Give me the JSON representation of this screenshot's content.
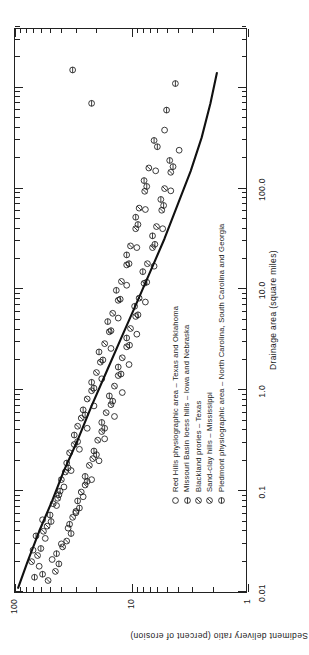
{
  "figure": {
    "orientation": "rotated-90-ccw",
    "line_color": "#111111",
    "axis_color": "#222222"
  },
  "chart_data": {
    "type": "scatter",
    "title": "",
    "xlabel": "Drainage area (square miles)",
    "ylabel": "Sediment delivery ratio (percent of erosion)",
    "xscale": "log",
    "yscale": "log",
    "xlim": [
      0.01,
      4000
    ],
    "ylim": [
      1,
      100
    ],
    "xticks": [
      0.01,
      0.1,
      1.0,
      10.0,
      100.0
    ],
    "xtick_labels": [
      "0.01",
      "0.1",
      "1.0",
      "10.0",
      "100.0"
    ],
    "yticks": [
      1,
      10,
      100
    ],
    "ytick_labels": [
      "1",
      "10",
      "100"
    ],
    "grid": false,
    "legend_position": "inside-lower-right",
    "series": [
      {
        "name": "Red Hills physiographic area – Texas and Oklahoma",
        "marker": "open-circle",
        "points": [
          [
            0.018,
            62
          ],
          [
            0.021,
            48
          ],
          [
            0.026,
            70
          ],
          [
            0.03,
            40
          ],
          [
            0.034,
            55
          ],
          [
            0.043,
            35
          ],
          [
            0.052,
            58
          ],
          [
            0.061,
            30
          ],
          [
            0.072,
            44
          ],
          [
            0.088,
            26
          ],
          [
            0.11,
            38
          ],
          [
            0.13,
            22
          ],
          [
            0.16,
            33
          ],
          [
            0.2,
            19
          ],
          [
            0.26,
            28
          ],
          [
            0.33,
            17
          ],
          [
            0.42,
            24
          ],
          [
            0.55,
            14
          ],
          [
            0.7,
            21
          ],
          [
            0.95,
            12
          ],
          [
            1.3,
            18
          ],
          [
            1.8,
            10.5
          ],
          [
            2.6,
            15
          ],
          [
            3.6,
            9.0
          ],
          [
            5.2,
            13
          ],
          [
            7.5,
            7.6
          ],
          [
            11,
            11
          ],
          [
            17,
            6.4
          ],
          [
            26,
            9.0
          ],
          [
            40,
            5.4
          ],
          [
            62,
            7.6
          ],
          [
            95,
            4.6
          ],
          [
            150,
            6.2
          ],
          [
            240,
            3.9
          ],
          [
            380,
            5.2
          ]
        ]
      },
      {
        "name": "Missouri Basin loess hills – Iowa and Nebraska",
        "marker": "circle-hbar",
        "points": [
          [
            0.015,
            58
          ],
          [
            0.024,
            44
          ],
          [
            0.036,
            66
          ],
          [
            0.047,
            34
          ],
          [
            0.058,
            50
          ],
          [
            0.08,
            29
          ],
          [
            0.1,
            41
          ],
          [
            0.14,
            25
          ],
          [
            0.19,
            36
          ],
          [
            0.25,
            21
          ],
          [
            0.36,
            31
          ],
          [
            0.48,
            18
          ],
          [
            0.64,
            26
          ],
          [
            0.88,
            15.5
          ],
          [
            1.2,
            22
          ],
          [
            1.7,
            13
          ],
          [
            2.4,
            19
          ],
          [
            3.3,
            11
          ],
          [
            4.8,
            16
          ],
          [
            6.8,
            9.4
          ],
          [
            9.8,
            13.5
          ],
          [
            15,
            8.0
          ],
          [
            22,
            11
          ],
          [
            34,
            6.6
          ],
          [
            52,
            9.2
          ],
          [
            78,
            5.6
          ],
          [
            120,
            7.8
          ],
          [
            190,
            4.7
          ],
          [
            300,
            6.4
          ],
          [
            600,
            5.0
          ],
          [
            1100,
            4.2
          ]
        ]
      },
      {
        "name": "Blackland prories – Texas",
        "marker": "circle-slash",
        "points": [
          [
            0.013,
            52
          ],
          [
            0.02,
            72
          ],
          [
            0.028,
            39
          ],
          [
            0.04,
            57
          ],
          [
            0.055,
            32
          ],
          [
            0.075,
            47
          ],
          [
            0.098,
            27
          ],
          [
            0.13,
            40
          ],
          [
            0.18,
            23
          ],
          [
            0.24,
            34
          ],
          [
            0.32,
            19.5
          ],
          [
            0.44,
            29
          ],
          [
            0.6,
            16.5
          ],
          [
            0.82,
            24
          ],
          [
            1.1,
            14
          ],
          [
            1.5,
            20
          ],
          [
            2.1,
            12
          ],
          [
            2.9,
            17
          ],
          [
            4.1,
            10.2
          ],
          [
            5.8,
            14.5
          ],
          [
            8.2,
            8.6
          ],
          [
            12,
            12.2
          ],
          [
            18,
            7.3
          ],
          [
            27,
            10.2
          ],
          [
            42,
            6.1
          ],
          [
            64,
            8.6
          ],
          [
            100,
            5.2
          ],
          [
            160,
            7.1
          ]
        ]
      },
      {
        "name": "Sand-clay hills – Mississippi",
        "marker": "circle-slash2",
        "points": [
          [
            0.016,
            45
          ],
          [
            0.023,
            64
          ],
          [
            0.032,
            36
          ],
          [
            0.045,
            53
          ],
          [
            0.063,
            30
          ],
          [
            0.085,
            43
          ],
          [
            0.115,
            25
          ],
          [
            0.155,
            37
          ],
          [
            0.21,
            21.5
          ],
          [
            0.29,
            31
          ],
          [
            0.39,
            18
          ],
          [
            0.53,
            27
          ],
          [
            0.72,
            15
          ],
          [
            0.99,
            22
          ],
          [
            1.4,
            13
          ],
          [
            1.9,
            18.5
          ],
          [
            2.7,
            11
          ],
          [
            3.8,
            15.5
          ],
          [
            5.4,
            9.2
          ],
          [
            7.8,
            13
          ],
          [
            11.5,
            7.8
          ],
          [
            17.5,
            11
          ],
          [
            26,
            6.6
          ],
          [
            40,
            9.2
          ],
          [
            61,
            5.5
          ],
          [
            94,
            7.7
          ],
          [
            145,
            4.6
          ]
        ]
      },
      {
        "name": "Piedmont physiographic area – North Carolina, South Carolina and Georgia",
        "marker": "circle-hbar2",
        "points": [
          [
            0.014,
            68
          ],
          [
            0.019,
            42
          ],
          [
            0.027,
            60
          ],
          [
            0.038,
            33
          ],
          [
            0.05,
            49
          ],
          [
            0.068,
            28
          ],
          [
            0.092,
            42
          ],
          [
            0.125,
            24
          ],
          [
            0.17,
            35
          ],
          [
            0.23,
            20
          ],
          [
            0.31,
            29
          ],
          [
            0.42,
            17
          ],
          [
            0.57,
            25
          ],
          [
            0.78,
            14.5
          ],
          [
            1.05,
            21
          ],
          [
            1.45,
            12.3
          ],
          [
            2.0,
            17.6
          ],
          [
            2.8,
            10.4
          ],
          [
            3.9,
            15
          ],
          [
            5.6,
            8.8
          ],
          [
            8.0,
            12.5
          ],
          [
            11.8,
            7.4
          ],
          [
            18,
            10.5
          ],
          [
            28,
            6.3
          ],
          [
            44,
            8.8
          ],
          [
            68,
            5.3
          ],
          [
            105,
            7.4
          ],
          [
            165,
            4.4
          ],
          [
            260,
            6.0
          ],
          [
            700,
            22
          ],
          [
            1500,
            32
          ]
        ]
      }
    ],
    "trend_line": {
      "label": "",
      "points": [
        [
          0.011,
          94
        ],
        [
          0.02,
          78
        ],
        [
          0.04,
          62
        ],
        [
          0.08,
          48
        ],
        [
          0.16,
          38
        ],
        [
          0.32,
          29
        ],
        [
          0.7,
          22
        ],
        [
          1.5,
          16.5
        ],
        [
          3.2,
          12.4
        ],
        [
          7.0,
          9.2
        ],
        [
          15,
          6.9
        ],
        [
          32,
          5.2
        ],
        [
          70,
          4.0
        ],
        [
          150,
          3.1
        ],
        [
          320,
          2.5
        ],
        [
          700,
          2.1
        ],
        [
          1400,
          1.85
        ]
      ]
    }
  },
  "legend": {
    "entries": [
      {
        "marker": "open-circle",
        "label": "Red Hills physiographic area – Texas and Oklahoma"
      },
      {
        "marker": "circle-hbar",
        "label": "Missouri Basin loess hills – Iowa and Nebraska"
      },
      {
        "marker": "circle-slash",
        "label": "Blackland prories – Texas"
      },
      {
        "marker": "circle-slash2",
        "label": "Sand-clay hills – Mississippi"
      },
      {
        "marker": "circle-hbar2",
        "label": "Piedmont physiographic area – North Carolina, South Carolina and Georgia"
      }
    ]
  }
}
